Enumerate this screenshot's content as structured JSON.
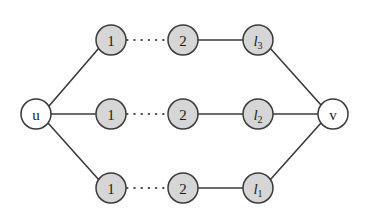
{
  "figure": {
    "type": "graph-diagram",
    "background_color": "#ffffff",
    "node_fill_gray": "#d6d6d6",
    "node_fill_white": "#ffffff",
    "node_stroke": "#3a3a3a",
    "edge_color": "#3b3b3b"
  },
  "nodes": {
    "source": {
      "id": "u",
      "label": "u",
      "cx": 36,
      "cy": 114,
      "r": 15,
      "style": "white"
    },
    "sink": {
      "id": "v",
      "label": "v",
      "cx": 333,
      "cy": 114,
      "r": 15,
      "style": "white"
    },
    "top": [
      {
        "id": "t1",
        "label": "1",
        "cx": 111,
        "cy": 40,
        "r": 15,
        "style": "gray"
      },
      {
        "id": "t2",
        "label": "2",
        "cx": 183,
        "cy": 40,
        "r": 15,
        "style": "gray"
      },
      {
        "id": "t3",
        "label": "l",
        "sub": "3",
        "cx": 258,
        "cy": 40,
        "r": 15,
        "style": "gray",
        "italic": true
      }
    ],
    "middle": [
      {
        "id": "m1",
        "label": "1",
        "cx": 111,
        "cy": 114,
        "r": 15,
        "style": "gray"
      },
      {
        "id": "m2",
        "label": "2",
        "cx": 183,
        "cy": 114,
        "r": 15,
        "style": "gray"
      },
      {
        "id": "m3",
        "label": "l",
        "sub": "2",
        "cx": 258,
        "cy": 114,
        "r": 15,
        "style": "gray",
        "italic": true
      }
    ],
    "bottom": [
      {
        "id": "b1",
        "label": "1",
        "cx": 111,
        "cy": 188,
        "r": 15,
        "style": "gray"
      },
      {
        "id": "b2",
        "label": "2",
        "cx": 183,
        "cy": 188,
        "r": 15,
        "style": "gray"
      },
      {
        "id": "b3",
        "label": "l",
        "sub": "1",
        "cx": 258,
        "cy": 188,
        "r": 15,
        "style": "gray",
        "italic": true
      }
    ]
  },
  "edges": [
    {
      "from": "u",
      "to": "t1",
      "style": "solid",
      "x1": 49,
      "y1": 106,
      "x2": 99,
      "y2": 48
    },
    {
      "from": "t1",
      "to": "t2",
      "style": "dotted",
      "x1": 127,
      "y1": 40,
      "x2": 167,
      "y2": 40
    },
    {
      "from": "t2",
      "to": "t3",
      "style": "solid",
      "x1": 198,
      "y1": 40,
      "x2": 243,
      "y2": 40
    },
    {
      "from": "t3",
      "to": "v",
      "style": "solid",
      "x1": 270,
      "y1": 48,
      "x2": 321,
      "y2": 105
    },
    {
      "from": "u",
      "to": "m1",
      "style": "solid",
      "x1": 51,
      "y1": 114,
      "x2": 96,
      "y2": 114
    },
    {
      "from": "m1",
      "to": "m2",
      "style": "dotted",
      "x1": 127,
      "y1": 114,
      "x2": 167,
      "y2": 114
    },
    {
      "from": "m2",
      "to": "m3",
      "style": "solid",
      "x1": 198,
      "y1": 114,
      "x2": 243,
      "y2": 114
    },
    {
      "from": "m3",
      "to": "v",
      "style": "solid",
      "x1": 273,
      "y1": 114,
      "x2": 318,
      "y2": 114
    },
    {
      "from": "u",
      "to": "b1",
      "style": "solid",
      "x1": 48,
      "y1": 123,
      "x2": 99,
      "y2": 180
    },
    {
      "from": "b1",
      "to": "b2",
      "style": "dotted",
      "x1": 127,
      "y1": 188,
      "x2": 167,
      "y2": 188
    },
    {
      "from": "b2",
      "to": "b3",
      "style": "solid",
      "x1": 198,
      "y1": 188,
      "x2": 243,
      "y2": 188
    },
    {
      "from": "b3",
      "to": "v",
      "style": "solid",
      "x1": 270,
      "y1": 180,
      "x2": 321,
      "y2": 123
    }
  ]
}
